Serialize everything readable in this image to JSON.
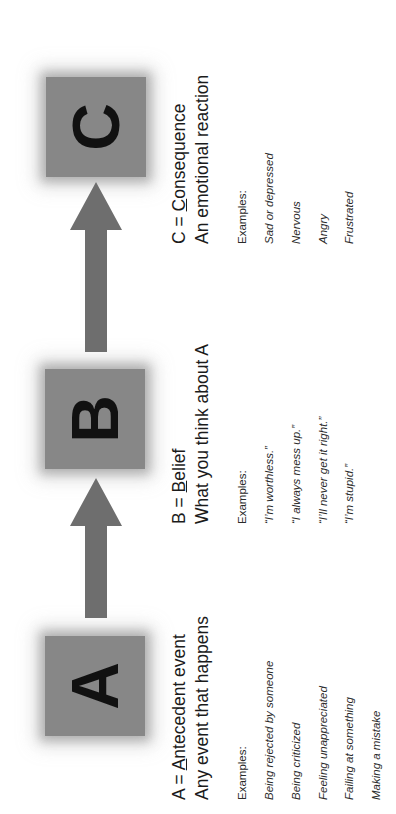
{
  "diagram": {
    "box_fill_color": "#878787",
    "letter_color": "#111111",
    "background_color": "#ffffff",
    "arrow_color": "#6e6e6e"
  },
  "nodes": [
    {
      "letter": "A",
      "heading_prefix": "A = ",
      "heading_underlined": "A",
      "heading_rest": "ntecedent event",
      "heading_line2": "Any event that happens",
      "examples_label": "Examples:",
      "examples": [
        "Being rejected by someone",
        "Being criticized",
        "Feeling unappreciated",
        "Failing at something",
        "Making a mistake"
      ]
    },
    {
      "letter": "B",
      "heading_prefix": "B = ",
      "heading_underlined": "B",
      "heading_rest": "elief",
      "heading_line2": "What you think about A",
      "examples_label": "Examples:",
      "examples": [
        "“I’m worthless.”",
        "“I always mess up.”",
        "“I’ll never get it right.”",
        "“I’m stupid.”"
      ]
    },
    {
      "letter": "C",
      "heading_prefix": "C = ",
      "heading_underlined": "C",
      "heading_rest": "onsequence",
      "heading_line2": "An emotional reaction",
      "examples_label": "Examples:",
      "examples": [
        "Sad or depressed",
        "Nervous",
        "Angry",
        "Frustrated"
      ]
    }
  ],
  "arrows": [
    {
      "name": "arrow-a-to-b",
      "direction": "right"
    },
    {
      "name": "arrow-b-to-c",
      "direction": "right"
    }
  ]
}
